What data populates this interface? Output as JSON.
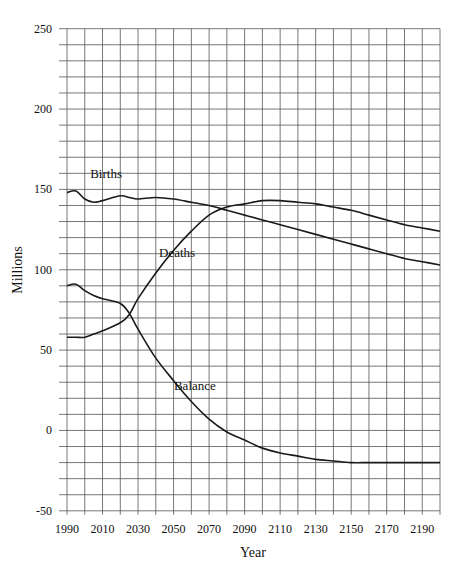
{
  "chart_data": {
    "type": "line",
    "title": "",
    "xlabel": "Year",
    "ylabel": "Millions",
    "xlim": [
      1990,
      2200
    ],
    "ylim": [
      -50,
      250
    ],
    "grid": true,
    "legend": "inline labels on curves",
    "x_ticks": [
      1990,
      2010,
      2030,
      2050,
      2070,
      2090,
      2110,
      2130,
      2150,
      2170,
      2190
    ],
    "y_ticks": [
      250,
      200,
      150,
      100,
      50,
      0,
      -50
    ],
    "x": [
      1990,
      1995,
      2000,
      2005,
      2010,
      2020,
      2025,
      2030,
      2040,
      2050,
      2060,
      2070,
      2080,
      2090,
      2100,
      2110,
      2120,
      2130,
      2140,
      2150,
      2160,
      2170,
      2180,
      2190,
      2200
    ],
    "series": [
      {
        "name": "Births",
        "values": [
          148,
          149,
          144,
          142,
          143,
          146,
          145,
          144,
          145,
          144,
          142,
          140,
          137,
          134,
          131,
          128,
          125,
          122,
          119,
          116,
          113,
          110,
          107,
          105,
          103
        ]
      },
      {
        "name": "Deaths",
        "values": [
          58,
          58,
          58,
          60,
          62,
          67,
          72,
          82,
          98,
          112,
          124,
          134,
          139,
          141,
          143,
          143,
          142,
          141,
          139,
          137,
          134,
          131,
          128,
          126,
          124
        ]
      },
      {
        "name": "Balance",
        "values": [
          90,
          91,
          87,
          84,
          82,
          79,
          73,
          63,
          45,
          31,
          18,
          7,
          -1,
          -6,
          -11,
          -14,
          -16,
          -18,
          -19,
          -20,
          -20,
          -20,
          -20,
          -20,
          -20
        ]
      }
    ],
    "annotations": [
      {
        "text": "Births",
        "x": 2012,
        "y": 157
      },
      {
        "text": "Deaths",
        "x": 2052,
        "y": 108
      },
      {
        "text": "Balance",
        "x": 2062,
        "y": 25
      }
    ]
  }
}
